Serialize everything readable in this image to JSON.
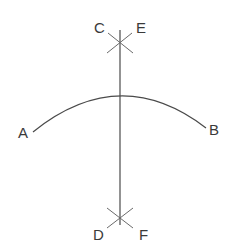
{
  "diagram": {
    "type": "geometric-construction",
    "labels": {
      "A": "A",
      "B": "B",
      "C": "C",
      "D": "D",
      "E": "E",
      "F": "F"
    },
    "points": {
      "A": [
        33,
        131
      ],
      "B": [
        206,
        127
      ],
      "top_intersection": [
        120,
        40
      ],
      "bottom_intersection": [
        120,
        219
      ]
    },
    "colors": {
      "line": "#4a4a4a",
      "text": "#3a3a3a",
      "background": "#ffffff"
    }
  }
}
